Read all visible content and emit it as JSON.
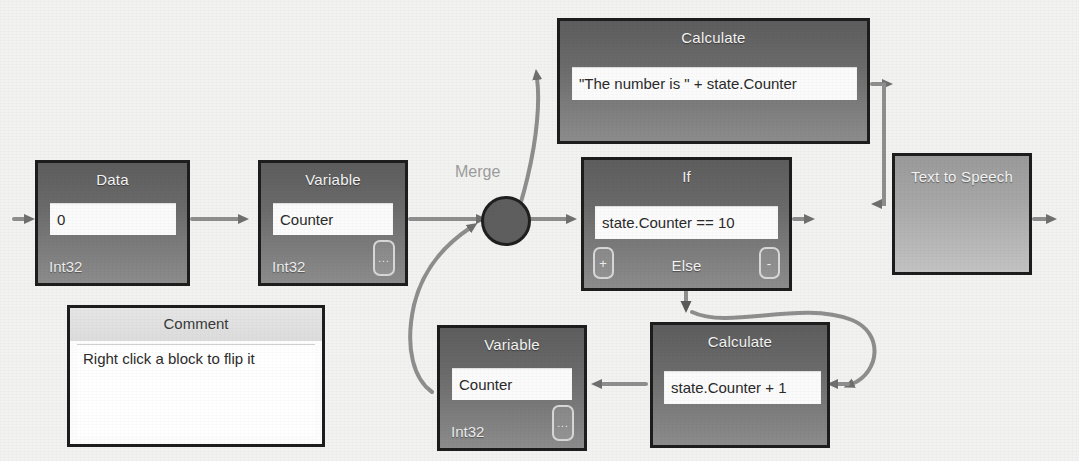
{
  "diagram": {
    "background_color": "#f2f2f0",
    "block_fill_dark": "#6b6b6b",
    "block_fill_light": "#a7a7a7",
    "block_border": "#1d1d1d",
    "wire_color": "#8e8e8e",
    "merge": {
      "label": "Merge",
      "label_color": "#9c9c9c",
      "node_color": "#5e5e5e"
    },
    "blocks": [
      {
        "id": "data",
        "title": "Data",
        "value": "0",
        "type_label": "Int32",
        "has_ellipsis_button": false
      },
      {
        "id": "variable-1",
        "title": "Variable",
        "value": "Counter",
        "type_label": "Int32",
        "has_ellipsis_button": true,
        "ellipsis_label": "..."
      },
      {
        "id": "calculate-1",
        "title": "Calculate",
        "value": "\"The number is \" + state.Counter",
        "type_label": "",
        "has_ellipsis_button": false
      },
      {
        "id": "if",
        "title": "If",
        "value": "state.Counter == 10",
        "else_label": "Else",
        "add_button_label": "+",
        "remove_button_label": "-"
      },
      {
        "id": "text-to-speech",
        "title": "Text to Speech",
        "value": "",
        "type_label": ""
      },
      {
        "id": "variable-2",
        "title": "Variable",
        "value": "Counter",
        "type_label": "Int32",
        "has_ellipsis_button": true,
        "ellipsis_label": "..."
      },
      {
        "id": "calculate-2",
        "title": "Calculate",
        "value": "state.Counter + 1",
        "type_label": "",
        "has_ellipsis_button": false
      },
      {
        "id": "comment",
        "title": "Comment",
        "value": "Right click a block to flip it",
        "type_label": ""
      }
    ]
  }
}
